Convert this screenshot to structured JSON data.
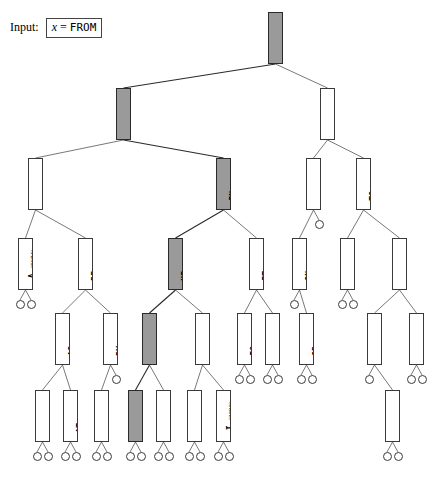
{
  "input": {
    "label": "Input:",
    "variable": "x",
    "equals": "=",
    "value": "FROM"
  },
  "legend": {
    "highlight_color": "#9a9a9a",
    "node_fill": "#ffffff",
    "edge_color": "#4a4a4a"
  },
  "tree": {
    "description": "Binary search tree of common English words with occurrence counts; search path for x = FROM is highlighted.",
    "search_path": [
      "OF",
      "FOR",
      "IN",
      "HE",
      "HAD",
      "FROM"
    ],
    "nodes": [
      {
        "id": "OF",
        "word": "OF",
        "count": "(21020)",
        "highlight": true,
        "x": 268,
        "y": 12,
        "w": 15,
        "h": 52
      },
      {
        "id": "FOR",
        "word": "FOR",
        "count": "(1869)",
        "highlight": true,
        "x": 116,
        "y": 88,
        "w": 15,
        "h": 52
      },
      {
        "id": "THE",
        "word": "THE",
        "count": "(15568)",
        "highlight": false,
        "x": 320,
        "y": 88,
        "w": 15,
        "h": 52
      },
      {
        "id": "AND",
        "word": "AND",
        "count": "(7638)",
        "highlight": false,
        "x": 28,
        "y": 158,
        "w": 15,
        "h": 52
      },
      {
        "id": "IN",
        "word": "IN",
        "count": "(4313)",
        "highlight": true,
        "x": 216,
        "y": 158,
        "w": 15,
        "h": 52
      },
      {
        "id": "THAT",
        "word": "THAT",
        "count": "(3917)",
        "highlight": false,
        "x": 306,
        "y": 158,
        "w": 15,
        "h": 52
      },
      {
        "id": "TO",
        "word": "TO",
        "count": "(5739)",
        "highlight": false,
        "x": 356,
        "y": 158,
        "w": 15,
        "h": 52
      },
      {
        "id": "A",
        "word": "A",
        "count": "(5074)",
        "highlight": false,
        "x": 18,
        "y": 238,
        "w": 15,
        "h": 52
      },
      {
        "id": "BE",
        "word": "BE",
        "count": "(1535)",
        "highlight": false,
        "x": 78,
        "y": 238,
        "w": 15,
        "h": 52
      },
      {
        "id": "HE",
        "word": "HE",
        "count": "(1727)",
        "highlight": true,
        "x": 168,
        "y": 238,
        "w": 15,
        "h": 52
      },
      {
        "id": "IT",
        "word": "IT",
        "count": "(2285)",
        "highlight": false,
        "x": 249,
        "y": 238,
        "w": 15,
        "h": 52
      },
      {
        "id": "ON",
        "word": "ON",
        "count": "(1155)",
        "highlight": false,
        "x": 292,
        "y": 238,
        "w": 15,
        "h": 52
      },
      {
        "id": "THIS",
        "word": "THIS",
        "count": "(1021)",
        "highlight": false,
        "x": 340,
        "y": 238,
        "w": 15,
        "h": 52
      },
      {
        "id": "WITH",
        "word": "WITH",
        "count": "(4849)",
        "highlight": false,
        "x": 392,
        "y": 238,
        "w": 15,
        "h": 52
      },
      {
        "id": "AS",
        "word": "AS",
        "count": "(1853)",
        "highlight": false,
        "x": 55,
        "y": 313,
        "w": 15,
        "h": 52
      },
      {
        "id": "BY",
        "word": "BY",
        "count": "(1392)",
        "highlight": false,
        "x": 103,
        "y": 313,
        "w": 15,
        "h": 52
      },
      {
        "id": "HAD",
        "word": "HAD",
        "count": "(1062)",
        "highlight": true,
        "x": 142,
        "y": 313,
        "w": 15,
        "h": 52
      },
      {
        "id": "HIS",
        "word": "HIS",
        "count": "(1732)",
        "highlight": false,
        "x": 195,
        "y": 313,
        "w": 15,
        "h": 52
      },
      {
        "id": "IS",
        "word": "IS",
        "count": "(2509)",
        "highlight": false,
        "x": 237,
        "y": 313,
        "w": 15,
        "h": 52
      },
      {
        "id": "NOT",
        "word": "NOT",
        "count": "(1496)",
        "highlight": false,
        "x": 265,
        "y": 313,
        "w": 15,
        "h": 52
      },
      {
        "id": "OR",
        "word": "OR",
        "count": "(1011)",
        "highlight": false,
        "x": 299,
        "y": 313,
        "w": 15,
        "h": 52
      },
      {
        "id": "WAS",
        "word": "WAS",
        "count": "(1761)",
        "highlight": false,
        "x": 367,
        "y": 313,
        "w": 15,
        "h": 52
      },
      {
        "id": "YOU",
        "word": "YOU",
        "count": "(1336)",
        "highlight": false,
        "x": 409,
        "y": 313,
        "w": 15,
        "h": 52
      },
      {
        "id": "ARE",
        "word": "ARE",
        "count": "(1222)",
        "highlight": false,
        "x": 35,
        "y": 390,
        "w": 15,
        "h": 52
      },
      {
        "id": "AT",
        "word": "AT",
        "count": "(1053)",
        "highlight": false,
        "x": 63,
        "y": 390,
        "w": 15,
        "h": 52
      },
      {
        "id": "BUT",
        "word": "BUT",
        "count": "(1379)",
        "highlight": false,
        "x": 94,
        "y": 390,
        "w": 15,
        "h": 52
      },
      {
        "id": "FROM",
        "word": "FROM",
        "count": "(1030)",
        "highlight": true,
        "x": 128,
        "y": 390,
        "w": 15,
        "h": 52
      },
      {
        "id": "HAVE",
        "word": "HAVE",
        "count": "(1344)",
        "highlight": false,
        "x": 156,
        "y": 390,
        "w": 15,
        "h": 52
      },
      {
        "id": "HER",
        "word": "HER",
        "count": "(1068)",
        "highlight": false,
        "x": 187,
        "y": 390,
        "w": 15,
        "h": 52
      },
      {
        "id": "I",
        "word": "I",
        "count": "(2292)",
        "highlight": false,
        "x": 216,
        "y": 390,
        "w": 15,
        "h": 52
      },
      {
        "id": "WHICH",
        "word": "WHICH",
        "count": "(1291)",
        "highlight": false,
        "x": 385,
        "y": 390,
        "w": 15,
        "h": 52
      }
    ],
    "edges": [
      {
        "from": "OF",
        "to": "FOR"
      },
      {
        "from": "OF",
        "to": "THE"
      },
      {
        "from": "FOR",
        "to": "AND"
      },
      {
        "from": "FOR",
        "to": "IN"
      },
      {
        "from": "THE",
        "to": "THAT"
      },
      {
        "from": "THE",
        "to": "TO"
      },
      {
        "from": "AND",
        "to": "A"
      },
      {
        "from": "AND",
        "to": "BE"
      },
      {
        "from": "IN",
        "to": "HE"
      },
      {
        "from": "IN",
        "to": "IT"
      },
      {
        "from": "THAT",
        "to": "ON"
      },
      {
        "from": "TO",
        "to": "THIS"
      },
      {
        "from": "TO",
        "to": "WITH"
      },
      {
        "from": "BE",
        "to": "AS"
      },
      {
        "from": "BE",
        "to": "BY"
      },
      {
        "from": "HE",
        "to": "HAD"
      },
      {
        "from": "HE",
        "to": "HIS"
      },
      {
        "from": "IT",
        "to": "IS"
      },
      {
        "from": "IT",
        "to": "NOT"
      },
      {
        "from": "ON",
        "to": "OR"
      },
      {
        "from": "WITH",
        "to": "WAS"
      },
      {
        "from": "WITH",
        "to": "YOU"
      },
      {
        "from": "AS",
        "to": "ARE"
      },
      {
        "from": "AS",
        "to": "AT"
      },
      {
        "from": "BY",
        "to": "BUT"
      },
      {
        "from": "HAD",
        "to": "FROM"
      },
      {
        "from": "HAD",
        "to": "HAVE"
      },
      {
        "from": "HIS",
        "to": "HER"
      },
      {
        "from": "HIS",
        "to": "I"
      },
      {
        "from": "WAS",
        "to": "WHICH"
      }
    ],
    "leaves": [
      {
        "parent": "A",
        "side": "left"
      },
      {
        "parent": "A",
        "side": "right"
      },
      {
        "parent": "THAT",
        "side": "right"
      },
      {
        "parent": "THIS",
        "side": "left"
      },
      {
        "parent": "THIS",
        "side": "right"
      },
      {
        "parent": "BY",
        "side": "right"
      },
      {
        "parent": "IS",
        "side": "left"
      },
      {
        "parent": "IS",
        "side": "right"
      },
      {
        "parent": "NOT",
        "side": "left"
      },
      {
        "parent": "NOT",
        "side": "right"
      },
      {
        "parent": "ON",
        "side": "left"
      },
      {
        "parent": "OR",
        "side": "left"
      },
      {
        "parent": "OR",
        "side": "right"
      },
      {
        "parent": "YOU",
        "side": "left"
      },
      {
        "parent": "YOU",
        "side": "right"
      },
      {
        "parent": "WAS",
        "side": "left"
      },
      {
        "parent": "ARE",
        "side": "left"
      },
      {
        "parent": "ARE",
        "side": "right"
      },
      {
        "parent": "AT",
        "side": "left"
      },
      {
        "parent": "AT",
        "side": "right"
      },
      {
        "parent": "BUT",
        "side": "left"
      },
      {
        "parent": "BUT",
        "side": "right"
      },
      {
        "parent": "FROM",
        "side": "left"
      },
      {
        "parent": "FROM",
        "side": "right"
      },
      {
        "parent": "HAVE",
        "side": "left"
      },
      {
        "parent": "HAVE",
        "side": "right"
      },
      {
        "parent": "HER",
        "side": "left"
      },
      {
        "parent": "HER",
        "side": "right"
      },
      {
        "parent": "I",
        "side": "left"
      },
      {
        "parent": "I",
        "side": "right"
      },
      {
        "parent": "WHICH",
        "side": "left"
      },
      {
        "parent": "WHICH",
        "side": "right"
      }
    ]
  }
}
